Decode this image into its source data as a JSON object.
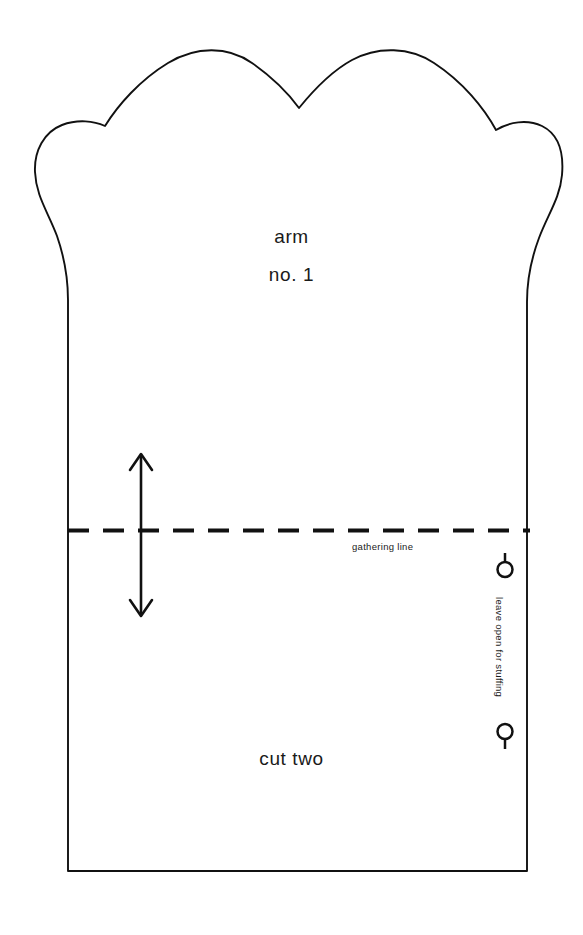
{
  "sheet": {
    "name": "sewing-pattern-sheet",
    "background_color": "#ffffff",
    "ink_color": "#111111",
    "width": 583,
    "height": 935
  },
  "piece": {
    "title": "arm",
    "number": "no. 1",
    "cut_instruction": "cut two",
    "shape_name": "paw-arm-pattern-piece",
    "top_edge_style": "scalloped-paw",
    "bottom_edge_style": "straight"
  },
  "markings": {
    "gathering_line_label": "gathering line",
    "gathering_line_style": "dashed",
    "leave_open_label": "leave open for stuffing",
    "grain_line_name": "grain-line-double-arrow",
    "pin_marker_top": "pin-marker-stem-up",
    "pin_marker_bottom": "pin-marker-stem-down"
  }
}
